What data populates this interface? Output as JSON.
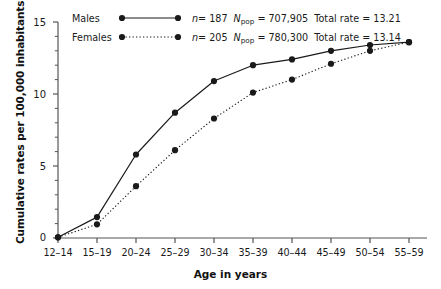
{
  "chart_data": {
    "type": "line",
    "title": "",
    "xlabel": "Age in years",
    "ylabel": "Cumulative rates per 100,000 inhabitants",
    "categories": [
      "12–14",
      "15–19",
      "20–24",
      "25–29",
      "30–34",
      "35–39",
      "40–44",
      "45–49",
      "50–54",
      "55–59"
    ],
    "ylim": [
      0,
      15
    ],
    "yticks": [
      0,
      5,
      10,
      15
    ],
    "ytick_labels": [
      "0",
      "5",
      "10",
      "15"
    ],
    "yminor_step": 1,
    "grid": false,
    "legend_position": "top-center",
    "series": [
      {
        "name": "Males",
        "style": "solid",
        "marker": "filled-circle",
        "color": "#1a1a1a",
        "n": 187,
        "n_label": "n = 187",
        "npop": "707,905",
        "npop_label": "N_pop = 707,905",
        "total_rate": 13.21,
        "total_rate_label": "Total rate = 13.21",
        "values": [
          0.05,
          1.45,
          5.8,
          8.7,
          10.9,
          12.0,
          12.4,
          13.0,
          13.4,
          13.6
        ]
      },
      {
        "name": "Females",
        "style": "dotted",
        "marker": "filled-circle",
        "color": "#1a1a1a",
        "n": 205,
        "n_label": "n = 205",
        "npop": "780,300",
        "npop_label": "N_pop = 780,300",
        "total_rate": 13.14,
        "total_rate_label": "Total rate = 13.14",
        "values": [
          0.05,
          0.95,
          3.6,
          6.1,
          8.3,
          10.1,
          11.0,
          12.1,
          13.0,
          13.6
        ]
      }
    ]
  },
  "legend": {
    "males_label": "Males",
    "females_label": "Females",
    "males_n": "n",
    "males_n_value": "= 187",
    "males_npop_n": "N",
    "males_npop_sub": "pop",
    "males_npop_value": "= 707,905",
    "males_rate": "Total rate = 13.21",
    "females_n": "n",
    "females_n_value": "= 205",
    "females_npop_n": "N",
    "females_npop_sub": "pop",
    "females_npop_value": "= 780,300",
    "females_rate": "Total rate = 13.14"
  },
  "axes": {
    "y_title": "Cumulative rates per 100,000 inhabitants",
    "x_title": "Age in years",
    "y_tick_0": "0",
    "y_tick_1": "5",
    "y_tick_2": "10",
    "y_tick_3": "15",
    "x_tick_0": "12–14",
    "x_tick_1": "15–19",
    "x_tick_2": "20–24",
    "x_tick_3": "25–29",
    "x_tick_4": "30–34",
    "x_tick_5": "35–39",
    "x_tick_6": "40–44",
    "x_tick_7": "45–49",
    "x_tick_8": "50–54",
    "x_tick_9": "55–59"
  },
  "colors": {
    "line": "#1a1a1a",
    "axis": "#555555",
    "background": "#ffffff"
  }
}
